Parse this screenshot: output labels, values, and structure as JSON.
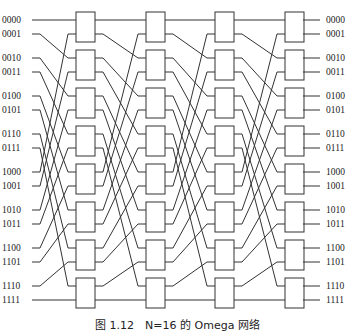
{
  "diagram": {
    "type": "omega-network",
    "stages": 4,
    "switches_per_stage": 8,
    "line_color": "#333333",
    "inputs": [
      "0000",
      "0001",
      "0010",
      "0011",
      "0100",
      "0101",
      "0110",
      "0111",
      "1000",
      "1001",
      "1010",
      "1011",
      "1100",
      "1101",
      "1110",
      "1111"
    ],
    "outputs": [
      "0000",
      "0001",
      "0010",
      "0011",
      "0100",
      "0101",
      "0110",
      "0111",
      "1000",
      "1001",
      "1010",
      "1011",
      "1100",
      "1101",
      "1110",
      "1111"
    ]
  },
  "caption": "图 1.12　N=16 的 Omega 网络"
}
